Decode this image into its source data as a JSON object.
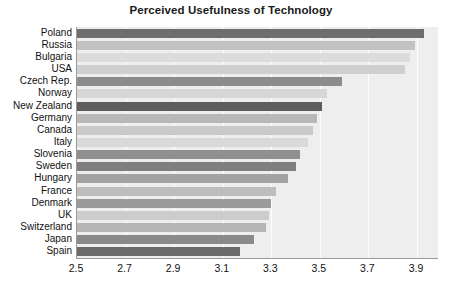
{
  "chart_data": {
    "type": "bar",
    "orientation": "horizontal",
    "title": "Perceived Usefulness of Technology",
    "xlabel": "",
    "ylabel": "",
    "xlim": [
      2.5,
      3.9
    ],
    "xticks": [
      "2.5",
      "2.7",
      "2.9",
      "3.1",
      "3.3",
      "3.5",
      "3.7",
      "3.9"
    ],
    "xtick_values": [
      2.5,
      2.7,
      2.9,
      3.1,
      3.3,
      3.5,
      3.7,
      3.9
    ],
    "grid": true,
    "grid_axis": "x",
    "legend": null,
    "plot_background": "#eeeeee",
    "categories": [
      "Poland",
      "Russia",
      "Bulgaria",
      "USA",
      "Czech Rep.",
      "Norway",
      "New Zealand",
      "Germany",
      "Canada",
      "Italy",
      "Slovenia",
      "Sweden",
      "Hungary",
      "France",
      "Denmark",
      "UK",
      "Switzerland",
      "Japan",
      "Spain"
    ],
    "values": [
      3.93,
      3.89,
      3.87,
      3.85,
      3.59,
      3.53,
      3.51,
      3.49,
      3.47,
      3.45,
      3.42,
      3.4,
      3.37,
      3.32,
      3.3,
      3.29,
      3.28,
      3.23,
      3.17
    ],
    "bar_colors": [
      "#6e6e6e",
      "#c2c2c2",
      "#dcdcdc",
      "#cfcfcf",
      "#8c8c8c",
      "#d6d6d6",
      "#5e5e5e",
      "#b8b8b8",
      "#c9c9c9",
      "#d9d9d9",
      "#8f8f8f",
      "#7f7f7f",
      "#a2a2a2",
      "#bdbdbd",
      "#9a9a9a",
      "#cccccc",
      "#b5b5b5",
      "#8a8a8a",
      "#6b6b6b"
    ]
  }
}
